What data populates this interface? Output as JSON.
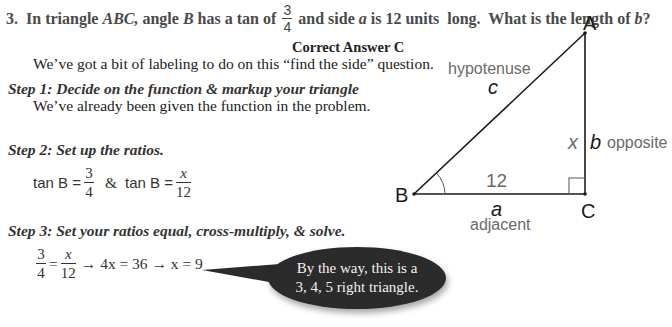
{
  "question": {
    "number": "3.",
    "text_part1": "In triangle ",
    "abc": "ABC,",
    "text_part2": " angle ",
    "b_angle": "B",
    "text_part3": " has a tan of",
    "frac_num": "3",
    "frac_den": "4",
    "text_part4": "and side ",
    "side_a": "a",
    "text_part5": " is 12 units  long.  What is the length of ",
    "side_b": "b",
    "text_part6": "?"
  },
  "answer_label": "Correct Answer C",
  "intro": "We’ve got a bit of labeling to do on this “find the side” question.",
  "steps": [
    {
      "title": "Step 1:  Decide on the function & markup your triangle",
      "body": "We’ve already been given the function in the problem."
    },
    {
      "title": "Step 2:  Set up the ratios.",
      "eq": {
        "fn1": "tan B =",
        "n1": "3",
        "d1": "4",
        "amp": "&",
        "fn2": "tan B =",
        "n2": "x",
        "d2": "12"
      }
    },
    {
      "title": "Step 3:  Set your ratios equal, cross-multiply, & solve.",
      "eq": {
        "n1": "3",
        "d1": "4",
        "eqsign": "=",
        "n2": "x",
        "d2": "12",
        "rest": "→ 4x = 36 → x = 9"
      }
    }
  ],
  "callout": {
    "line1": "By the way, this is a",
    "line2": "3, 4, 5 right triangle."
  },
  "diagram": {
    "vertex_a": "A",
    "vertex_b": "B",
    "vertex_c": "C",
    "hypotenuse_label": "hypotenuse",
    "side_c": "c",
    "side_x": "x",
    "side_b": "b",
    "opposite_label": "opposite",
    "side_length": "12",
    "side_a": "a",
    "adjacent_label": "adjacent",
    "line_color": "#1a1a1a",
    "label_color": "#6a6a6a"
  }
}
